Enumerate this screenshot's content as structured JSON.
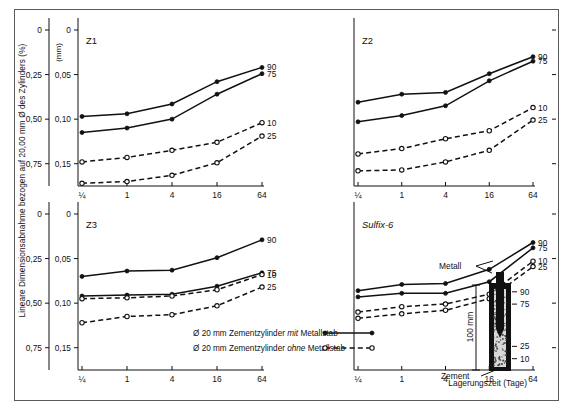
{
  "figure": {
    "y_axis_title": "Lineare Dimensionsabnahme bezogen auf 20,00 mm Ø des Zylinders (%)",
    "y_axis_secondary_unit": "(mm)",
    "x_axis_title": "Lagerungszeit (Tage)"
  },
  "legend": {
    "items": [
      {
        "label_pre": "Ø 20 mm Zementzylinder ",
        "label_em": "mit",
        "label_post": " Metallstab",
        "style": "solid-filled"
      },
      {
        "label_pre": "Ø 20 mm Zementzylinder ",
        "label_em": "ohne",
        "label_post": " Metallstab",
        "style": "dashed-open"
      }
    ]
  },
  "inset": {
    "label_metal": "Metall",
    "label_cement": "Zement",
    "dimension": "100 mm",
    "level_ticks": [
      "90",
      "75",
      "25",
      "10"
    ]
  },
  "chart_data": {
    "type": "line",
    "xlabel": "Lagerungszeit (Tage)",
    "ylabel": "Lineare Dimensionsabnahme bezogen auf 20,00 mm Ø des Zylinders (%)",
    "x": [
      "¼",
      "1",
      "4",
      "16",
      "64"
    ],
    "x_numeric": [
      0.25,
      1,
      4,
      16,
      64
    ],
    "x_scale": "log2",
    "ylim_percent": [
      0,
      0.875
    ],
    "ylim_mm": [
      0,
      0.175
    ],
    "y_ticks_percent": [
      "0",
      "0,25",
      "0,50",
      "0,75"
    ],
    "y_ticks_mm": [
      "0",
      "0,05",
      "0,10",
      "0,15"
    ],
    "y_tick_values_mm": [
      0,
      0.05,
      0.1,
      0.15
    ],
    "grid": false,
    "legend_position": "bottom-center",
    "note": "y values are given in mm (secondary scale); percent = mm x 5",
    "panels": [
      {
        "name": "Z1",
        "italic": false,
        "series": [
          {
            "name": "90",
            "style": "solid-filled",
            "values": [
              0.097,
              0.094,
              0.083,
              0.058,
              0.042
            ]
          },
          {
            "name": "75",
            "style": "solid-filled",
            "values": [
              0.115,
              0.11,
              0.1,
              0.072,
              0.049
            ]
          },
          {
            "name": "10",
            "style": "dashed-open",
            "values": [
              0.148,
              0.143,
              0.135,
              0.126,
              0.104
            ]
          },
          {
            "name": "25",
            "style": "dashed-open",
            "values": [
              0.172,
              0.17,
              0.163,
              0.149,
              0.119
            ]
          }
        ]
      },
      {
        "name": "Z2",
        "italic": false,
        "series": [
          {
            "name": "90",
            "style": "solid-filled",
            "values": [
              0.081,
              0.072,
              0.07,
              0.049,
              0.03
            ]
          },
          {
            "name": "75",
            "style": "solid-filled",
            "values": [
              0.103,
              0.096,
              0.085,
              0.057,
              0.035
            ]
          },
          {
            "name": "10",
            "style": "dashed-open",
            "values": [
              0.139,
              0.133,
              0.122,
              0.113,
              0.087
            ]
          },
          {
            "name": "25",
            "style": "dashed-open",
            "values": [
              0.158,
              0.157,
              0.148,
              0.135,
              0.101
            ]
          }
        ]
      },
      {
        "name": "Z3",
        "italic": false,
        "series": [
          {
            "name": "90",
            "style": "solid-filled",
            "values": [
              0.07,
              0.064,
              0.063,
              0.049,
              0.029
            ]
          },
          {
            "name": "75",
            "style": "solid-filled",
            "values": [
              0.092,
              0.091,
              0.09,
              0.081,
              0.066
            ]
          },
          {
            "name": "10",
            "style": "dashed-open",
            "values": [
              0.095,
              0.094,
              0.092,
              0.085,
              0.068
            ]
          },
          {
            "name": "25",
            "style": "dashed-open",
            "values": [
              0.122,
              0.115,
              0.113,
              0.103,
              0.082
            ]
          }
        ]
      },
      {
        "name": "Sulfix-6",
        "italic": true,
        "series": [
          {
            "name": "90",
            "style": "solid-filled",
            "values": [
              0.086,
              0.079,
              0.078,
              0.062,
              0.032
            ]
          },
          {
            "name": "75",
            "style": "solid-filled",
            "values": [
              0.093,
              0.089,
              0.089,
              0.076,
              0.038
            ]
          },
          {
            "name": "10",
            "style": "dashed-open",
            "values": [
              0.11,
              0.104,
              0.101,
              0.09,
              0.053
            ]
          },
          {
            "name": "25",
            "style": "dashed-open",
            "values": [
              0.117,
              0.112,
              0.108,
              0.095,
              0.059
            ]
          }
        ]
      }
    ]
  }
}
